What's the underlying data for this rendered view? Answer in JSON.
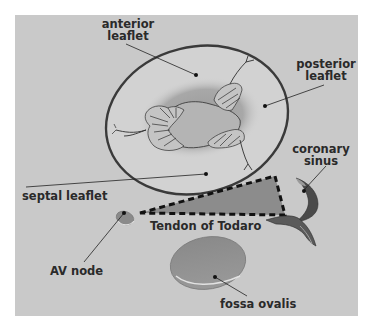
{
  "diagram": {
    "type": "anatomical illustration",
    "colors": {
      "background": "#ffffff",
      "panel": "#c9c9c9",
      "annulus_stroke": "#3a3a3a",
      "leaflet_fill": "#d2d2d2",
      "orifice_shadow": "#9a9a9a",
      "orifice_fill": "#b4b4b4",
      "triangle_fill": "#8c8c8c",
      "dash_stroke": "#111111",
      "sinus_fill": "#4a4a4a",
      "fossa_fill": "#8f8f8f",
      "av_node_fill": "#8a8a8a",
      "label_text": "#2a2a2a",
      "leader_line": "#222222"
    },
    "labels": {
      "anterior_leaflet": {
        "line1": "anterior",
        "line2": "leaflet"
      },
      "posterior_leaflet": {
        "line1": "posterior",
        "line2": "leaflet"
      },
      "coronary_sinus": {
        "line1": "coronary",
        "line2": "sinus"
      },
      "septal_leaflet": "septal leaflet",
      "tendon_of_todaro": "Tendon of Todaro",
      "av_node": "AV node",
      "fossa_ovalis": "fossa ovalis"
    }
  }
}
